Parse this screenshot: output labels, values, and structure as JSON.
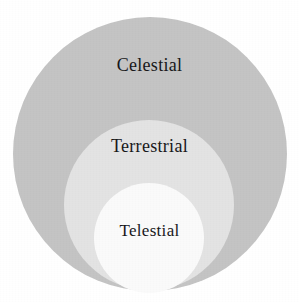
{
  "diagram": {
    "type": "nested-circles",
    "title": "",
    "background_color": "#ffffff",
    "width": 299,
    "height": 302,
    "regions": [
      {
        "id": "celestial",
        "label": "Celestial",
        "level": 1,
        "color": "#c4c4c4",
        "center_x": 150,
        "center_y": 154,
        "radius": 137
      },
      {
        "id": "terrestrial",
        "label": "Terrestrial",
        "level": 2,
        "color": "#e3e3e3",
        "center_x": 149,
        "center_y": 205,
        "radius": 85
      },
      {
        "id": "telestial",
        "label": "Telestial",
        "level": 3,
        "color": "#fafafa",
        "center_x": 149,
        "center_y": 238,
        "radius": 55
      }
    ]
  }
}
